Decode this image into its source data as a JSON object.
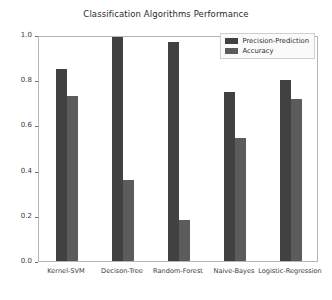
{
  "chart_data": {
    "type": "bar",
    "title": "Classification Algorithms Performance",
    "xlabel": "",
    "ylabel": "",
    "categories": [
      "Kernel-SVM",
      "Decison-Tree",
      "Random-Forest",
      "Naive-Bayes",
      "Logistic-Regression"
    ],
    "series": [
      {
        "name": "Precision-Prediction",
        "color": "#414141",
        "values": [
          0.85,
          0.99,
          0.97,
          0.75,
          0.8
        ]
      },
      {
        "name": "Accuracy",
        "color": "#5c5c5c",
        "values": [
          0.73,
          0.36,
          0.18,
          0.545,
          0.715
        ]
      }
    ],
    "ylim": [
      0.0,
      1.0
    ],
    "yticks": [
      "0.0",
      "0.2",
      "0.4",
      "0.6",
      "0.8",
      "1.0"
    ],
    "ytick_values": [
      0.0,
      0.2,
      0.4,
      0.6,
      0.8,
      1.0
    ],
    "grid": false,
    "legend_position": "upper right",
    "background_color": "#ffffff",
    "frame_color": "#b6b6b6"
  }
}
